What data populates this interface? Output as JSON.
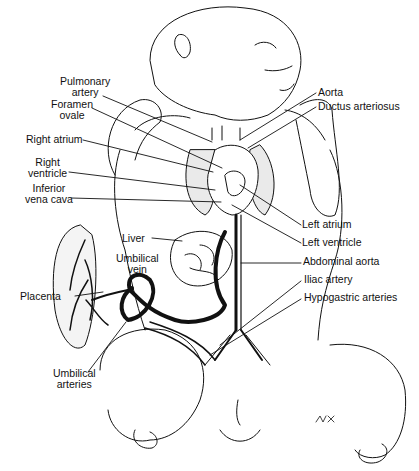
{
  "figure": {
    "labels_left": [
      {
        "id": "pulmonary_artery",
        "text": "Pulmonary\nartery"
      },
      {
        "id": "foramen_ovale",
        "text": "Foramen\novale"
      },
      {
        "id": "right_atrium",
        "text": "Right atrium"
      },
      {
        "id": "right_ventricle",
        "text": "Right\nventricle"
      },
      {
        "id": "inferior_vena_cava",
        "text": "Inferior\nvena cava"
      },
      {
        "id": "liver",
        "text": "Liver"
      },
      {
        "id": "umbilical_vein",
        "text": "Umbilical\nvein"
      },
      {
        "id": "placenta",
        "text": "Placenta"
      },
      {
        "id": "umbilical_arteries",
        "text": "Umbilical\narteries"
      }
    ],
    "labels_right": [
      {
        "id": "aorta",
        "text": "Aorta"
      },
      {
        "id": "ductus_arteriosus",
        "text": "Ductus arteriosus"
      },
      {
        "id": "left_atrium",
        "text": "Left atrium"
      },
      {
        "id": "left_ventricle",
        "text": "Left ventricle"
      },
      {
        "id": "abdominal_aorta",
        "text": "Abdominal aorta"
      },
      {
        "id": "iliac_artery",
        "text": "Iliac artery"
      },
      {
        "id": "hypogastric_arteries",
        "text": "Hypogastric arteries"
      }
    ],
    "signature": "MK"
  },
  "text": {
    "pulmonary_1": "Pulmonary",
    "pulmonary_2": "artery",
    "foramen_1": "Foramen",
    "foramen_2": "ovale",
    "right_atrium": "Right atrium",
    "rv_1": "Right",
    "rv_2": "ventricle",
    "ivc_1": "Inferior",
    "ivc_2": "vena cava",
    "liver": "Liver",
    "uv_1": "Umbilical",
    "uv_2": "vein",
    "placenta": "Placenta",
    "ua_1": "Umbilical",
    "ua_2": "arteries",
    "aorta": "Aorta",
    "ductus": "Ductus arteriosus",
    "left_atrium": "Left atrium",
    "left_ventricle": "Left ventricle",
    "abdominal_aorta": "Abdominal aorta",
    "iliac": "Iliac artery",
    "hypogastric": "Hypogastric arteries",
    "signature": "MK"
  }
}
